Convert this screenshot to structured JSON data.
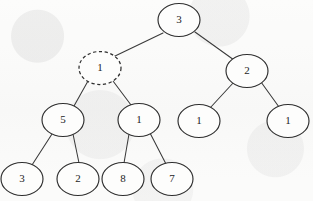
{
  "figure": {
    "kind": "binary-tree-diagram",
    "width": 313,
    "height": 201,
    "background_color": "#fbfbfa",
    "stroke_color": "#2e2e2e",
    "text_color": "#1c1c1c"
  },
  "chart_data": {
    "type": "diagram",
    "subtype": "binary-tree",
    "title": "",
    "xlabel": "",
    "ylabel": "",
    "grid": false,
    "legend": "none",
    "node_shape": "ellipse",
    "node_rx": 21,
    "node_ry": 16.5,
    "levels": 4,
    "highlighted_node_ids": [
      "n1"
    ],
    "highlight_style": "dashed-outline",
    "nodes": [
      {
        "id": "n0",
        "label": "3",
        "cx": 179,
        "cy": 20,
        "level": 0,
        "style": "solid",
        "parent": null,
        "side": "root"
      },
      {
        "id": "n1",
        "label": "1",
        "cx": 100,
        "cy": 68,
        "level": 1,
        "style": "dashed",
        "parent": "n0",
        "side": "left"
      },
      {
        "id": "n2",
        "label": "2",
        "cx": 247,
        "cy": 71,
        "level": 1,
        "style": "solid",
        "parent": "n0",
        "side": "right"
      },
      {
        "id": "n3",
        "label": "5",
        "cx": 63,
        "cy": 120,
        "level": 2,
        "style": "solid",
        "parent": "n1",
        "side": "left"
      },
      {
        "id": "n4",
        "label": "1",
        "cx": 139,
        "cy": 120,
        "level": 2,
        "style": "solid",
        "parent": "n1",
        "side": "right"
      },
      {
        "id": "n5",
        "label": "1",
        "cx": 199,
        "cy": 121,
        "level": 2,
        "style": "solid",
        "parent": "n2",
        "side": "left"
      },
      {
        "id": "n6",
        "label": "1",
        "cx": 288,
        "cy": 121,
        "level": 2,
        "style": "solid",
        "parent": "n2",
        "side": "right"
      },
      {
        "id": "n7",
        "label": "3",
        "cx": 22,
        "cy": 179,
        "level": 3,
        "style": "solid",
        "parent": "n3",
        "side": "left"
      },
      {
        "id": "n8",
        "label": "2",
        "cx": 78,
        "cy": 179,
        "level": 3,
        "style": "solid",
        "parent": "n3",
        "side": "right"
      },
      {
        "id": "n9",
        "label": "8",
        "cx": 123,
        "cy": 179,
        "level": 3,
        "style": "solid",
        "parent": "n4",
        "side": "left"
      },
      {
        "id": "n10",
        "label": "7",
        "cx": 172,
        "cy": 179,
        "level": 3,
        "style": "solid",
        "parent": "n4",
        "side": "right"
      }
    ],
    "edges": [
      {
        "id": "e0",
        "from": "n0",
        "to": "n1",
        "x1": 163,
        "y1": 33,
        "x2": 113,
        "y2": 57
      },
      {
        "id": "e1",
        "from": "n0",
        "to": "n2",
        "x1": 195,
        "y1": 32,
        "x2": 234,
        "y2": 60
      },
      {
        "id": "e2",
        "from": "n1",
        "to": "n3",
        "x1": 88,
        "y1": 81,
        "x2": 74,
        "y2": 106
      },
      {
        "id": "e3",
        "from": "n1",
        "to": "n4",
        "x1": 113,
        "y1": 81,
        "x2": 131,
        "y2": 105
      },
      {
        "id": "e4",
        "from": "n2",
        "to": "n5",
        "x1": 234,
        "y1": 82,
        "x2": 210,
        "y2": 108
      },
      {
        "id": "e5",
        "from": "n2",
        "to": "n6",
        "x1": 261,
        "y1": 82,
        "x2": 279,
        "y2": 107
      },
      {
        "id": "e6",
        "from": "n3",
        "to": "n7",
        "x1": 52,
        "y1": 134,
        "x2": 32,
        "y2": 165
      },
      {
        "id": "e7",
        "from": "n3",
        "to": "n8",
        "x1": 73,
        "y1": 134,
        "x2": 79,
        "y2": 163
      },
      {
        "id": "e8",
        "from": "n4",
        "to": "n9",
        "x1": 129,
        "y1": 134,
        "x2": 124,
        "y2": 163
      },
      {
        "id": "e9",
        "from": "n4",
        "to": "n10",
        "x1": 150,
        "y1": 133,
        "x2": 166,
        "y2": 164
      }
    ]
  }
}
